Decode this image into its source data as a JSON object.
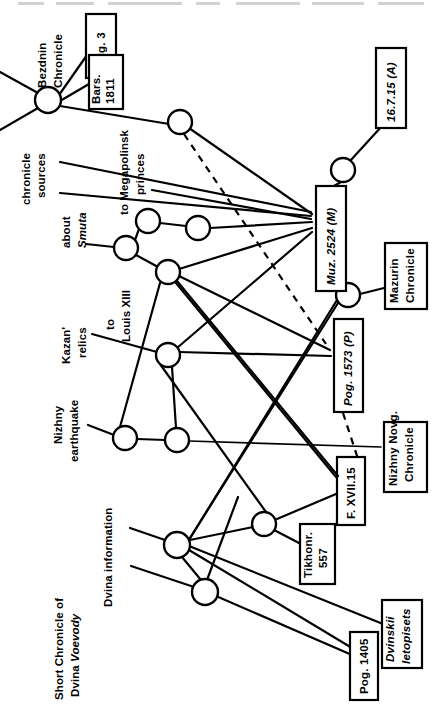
{
  "figure": {
    "type": "stemma-diagram",
    "orientation": "rotated-90-ccw",
    "background_color": "#ffffff",
    "ink_color": "#000000",
    "width": 442,
    "height": 705,
    "cropped_header_text": "—— ——— —————— —— ————— ————"
  },
  "boxes": [
    {
      "id": "dolg3",
      "label": "Dolg. 3",
      "italic": false,
      "x": 86,
      "y": 14,
      "w": 30,
      "h": 64,
      "rot": -90
    },
    {
      "id": "bars1811",
      "label": "Bars.\n1811",
      "italic": false,
      "x": 89,
      "y": 55,
      "w": 34,
      "h": 54,
      "rot": -90
    },
    {
      "id": "a16715",
      "label": "16.7.15 (A)",
      "italic": true,
      "x": 376,
      "y": 48,
      "w": 30,
      "h": 80,
      "rot": -90
    },
    {
      "id": "muz2524",
      "label": "Muz. 2524 (M)",
      "italic": true,
      "x": 316,
      "y": 186,
      "w": 30,
      "h": 105,
      "rot": -90
    },
    {
      "id": "mazurin",
      "label": "Mazurin\nChronicle",
      "italic": false,
      "x": 385,
      "y": 243,
      "w": 42,
      "h": 66,
      "rot": -90
    },
    {
      "id": "pog1573",
      "label": "Pog. 1573 (P)",
      "italic": true,
      "x": 334,
      "y": 319,
      "w": 29,
      "h": 93,
      "rot": -90
    },
    {
      "id": "nizhnynovg",
      "label": "Nizhny Novg.\nChronicle",
      "italic": false,
      "x": 384,
      "y": 422,
      "w": 43,
      "h": 70,
      "rot": -90
    },
    {
      "id": "fxvii15",
      "label": "F. XVII.15",
      "italic": false,
      "x": 337,
      "y": 457,
      "w": 28,
      "h": 68,
      "rot": -90
    },
    {
      "id": "tikhonr",
      "label": "Tikhonr.\n557",
      "italic": false,
      "x": 300,
      "y": 524,
      "w": 35,
      "h": 60,
      "rot": -90
    },
    {
      "id": "dvinskii",
      "label": "Dvinskii\nletopisets",
      "italic": true,
      "x": 382,
      "y": 600,
      "w": 40,
      "h": 68,
      "rot": -90
    },
    {
      "id": "pog1405",
      "label": "Pog. 1405",
      "italic": false,
      "x": 350,
      "y": 632,
      "w": 28,
      "h": 68,
      "rot": -90
    }
  ],
  "free_labels": [
    {
      "id": "bezdnin",
      "label": "Bezdnin\nChronicle",
      "italic": false,
      "x": 46,
      "y": 30,
      "rot": -90
    },
    {
      "id": "chronsources",
      "label": "chronicle\nsources",
      "italic": false,
      "x": 30,
      "y": 153,
      "rot": -90
    },
    {
      "id": "megapolinsk",
      "label": "to Megapolinsk\nprinces",
      "italic": false,
      "x": 128,
      "y": 138,
      "rot": -90
    },
    {
      "id": "smuta",
      "label": "about\nSmuta",
      "italic": true,
      "x": 70,
      "y": 215,
      "rot": -90,
      "first_line_roman": true
    },
    {
      "id": "louisxiii",
      "label": "to\nLouis XIII",
      "italic": false,
      "x": 114,
      "y": 298,
      "rot": -90
    },
    {
      "id": "kazanrelics",
      "label": "Kazan'\nrelics",
      "italic": false,
      "x": 70,
      "y": 322,
      "rot": -90
    },
    {
      "id": "nizhnyquake",
      "label": "Nizhny\nearthquake",
      "italic": false,
      "x": 62,
      "y": 400,
      "rot": -90
    },
    {
      "id": "dvinainfo",
      "label": "Dvina information",
      "italic": false,
      "x": 112,
      "y": 512,
      "rot": -90
    },
    {
      "id": "shortchron",
      "label": "Short Chronicle of\nDvina Voevody",
      "italic": false,
      "x": 63,
      "y": 608,
      "rot": -90,
      "second_line_italic_tail": "Voevody"
    }
  ],
  "nodes": [
    {
      "id": "n1",
      "cx": 48,
      "cy": 100,
      "r": 13
    },
    {
      "id": "n2",
      "cx": 180,
      "cy": 122,
      "r": 12
    },
    {
      "id": "n3",
      "cx": 148,
      "cy": 221,
      "r": 12
    },
    {
      "id": "n4",
      "cx": 198,
      "cy": 228,
      "r": 12
    },
    {
      "id": "n5",
      "cx": 126,
      "cy": 248,
      "r": 12
    },
    {
      "id": "n6",
      "cx": 168,
      "cy": 272,
      "r": 12
    },
    {
      "id": "n7",
      "cx": 168,
      "cy": 355,
      "r": 12
    },
    {
      "id": "n8",
      "cx": 125,
      "cy": 438,
      "r": 12
    },
    {
      "id": "n9",
      "cx": 177,
      "cy": 440,
      "r": 12
    },
    {
      "id": "n10",
      "cx": 343,
      "cy": 170,
      "r": 12
    },
    {
      "id": "n11",
      "cx": 348,
      "cy": 295,
      "r": 12
    },
    {
      "id": "n12",
      "cx": 264,
      "cy": 524,
      "r": 12
    },
    {
      "id": "n13",
      "cx": 177,
      "cy": 545,
      "r": 13
    },
    {
      "id": "n14",
      "cx": 265,
      "cy": 523,
      "r": 12
    },
    {
      "id": "n15",
      "cx": 205,
      "cy": 592,
      "r": 13
    }
  ],
  "edges": [
    {
      "from": "outside-left-upper",
      "to": "n1",
      "style": "solid"
    },
    {
      "from": "outside-left-lower",
      "to": "n1",
      "style": "solid"
    },
    {
      "from": "n1",
      "to": "dolg3",
      "style": "solid"
    },
    {
      "from": "n1",
      "to": "bars1811",
      "style": "solid"
    },
    {
      "from": "n1",
      "to": "n2",
      "style": "solid"
    },
    {
      "from": "n2",
      "to": "muz2524",
      "style": "solid"
    },
    {
      "from": "n2",
      "to": "pog1573",
      "style": "dashed"
    },
    {
      "from": "chronsources-1",
      "to": "muz2524",
      "style": "solid"
    },
    {
      "from": "chronsources-2",
      "to": "muz2524",
      "style": "solid"
    },
    {
      "from": "megapolinsk",
      "to": "muz2524",
      "style": "solid"
    },
    {
      "from": "n3",
      "to": "n4",
      "style": "solid"
    },
    {
      "from": "n3",
      "to": "n5",
      "style": "solid"
    },
    {
      "from": "n4",
      "to": "muz2524",
      "style": "solid"
    },
    {
      "from": "n5",
      "to": "smuta",
      "style": "solid"
    },
    {
      "from": "n5",
      "to": "n6",
      "style": "solid"
    },
    {
      "from": "n6",
      "to": "muz2524",
      "style": "solid"
    },
    {
      "from": "n6",
      "to": "pog1573",
      "style": "solid"
    },
    {
      "from": "n6",
      "to": "fxvii15",
      "style": "solid"
    },
    {
      "from": "n7",
      "to": "kazanrelics",
      "style": "solid"
    },
    {
      "from": "n7",
      "to": "muz2524",
      "style": "solid"
    },
    {
      "from": "n7",
      "to": "pog1573",
      "style": "solid"
    },
    {
      "from": "n7",
      "to": "n9",
      "style": "solid"
    },
    {
      "from": "n8",
      "to": "nizhnyquake",
      "style": "solid"
    },
    {
      "from": "n8",
      "to": "n9",
      "style": "solid"
    },
    {
      "from": "n9",
      "to": "nizhnynovg",
      "style": "solid"
    },
    {
      "from": "n10",
      "to": "a16715",
      "style": "solid"
    },
    {
      "from": "n10",
      "to": "muz2524",
      "style": "solid"
    },
    {
      "from": "n11",
      "to": "mazurin",
      "style": "solid"
    },
    {
      "from": "n11",
      "to": "muz2524",
      "style": "solid"
    },
    {
      "from": "n11",
      "to": "n13",
      "style": "solid"
    },
    {
      "from": "pog1573",
      "to": "nizhnynovg-dash",
      "style": "dashed"
    },
    {
      "from": "fxvii15",
      "to": "n12",
      "style": "solid"
    },
    {
      "from": "n12",
      "to": "tikhonr",
      "style": "solid"
    },
    {
      "from": "n12",
      "to": "n13",
      "style": "solid"
    },
    {
      "from": "n13",
      "to": "dvinainfo",
      "style": "solid"
    },
    {
      "from": "n13",
      "to": "n14",
      "style": "solid"
    },
    {
      "from": "n13",
      "to": "n15",
      "style": "solid"
    },
    {
      "from": "n13",
      "to": "pog1405",
      "style": "solid"
    },
    {
      "from": "n13",
      "to": "dvinskii",
      "style": "solid"
    },
    {
      "from": "n15",
      "to": "dvinainfo2",
      "style": "solid"
    },
    {
      "from": "n15",
      "to": "pog1405",
      "style": "solid"
    },
    {
      "from": "n14",
      "to": "fxvii15",
      "style": "solid"
    }
  ]
}
